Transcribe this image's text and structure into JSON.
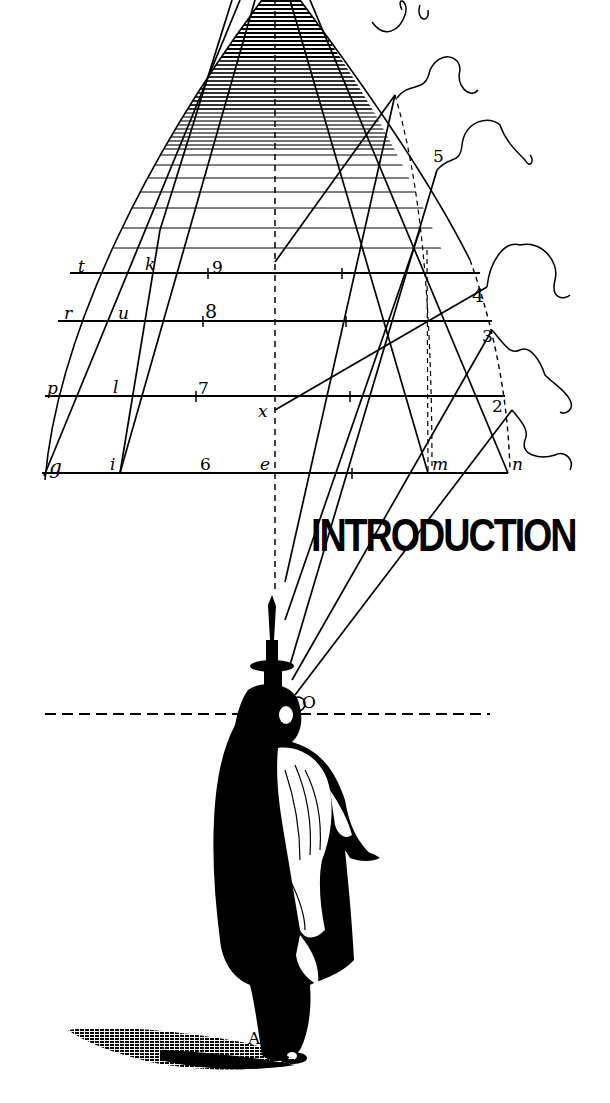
{
  "heading": {
    "title": "INTRODUCTION"
  },
  "diagram": {
    "point_labels": {
      "t": "t",
      "k": "k",
      "r": "r",
      "u": "u",
      "p": "p",
      "l": "l",
      "g": "g",
      "i": "i",
      "e": "e",
      "x": "x",
      "m": "m",
      "n": "n",
      "O": "O",
      "A": "A"
    },
    "numbers": {
      "n9": "9",
      "n8": "8",
      "n7": "7",
      "n6": "6",
      "n5": "5",
      "n4": "4",
      "n3": "3",
      "n2": "2"
    }
  },
  "colors": {
    "ink": "#000000",
    "paper": "#ffffff"
  }
}
